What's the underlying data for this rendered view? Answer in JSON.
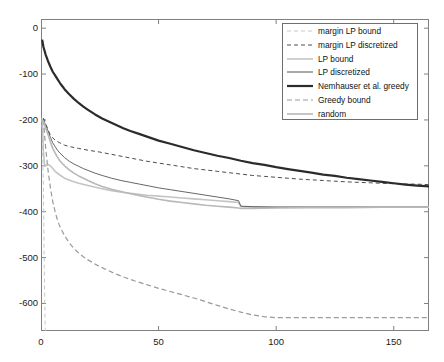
{
  "chart_data": {
    "type": "line",
    "title": "",
    "xlabel": "",
    "ylabel": "",
    "xlim": [
      0,
      165
    ],
    "ylim": [
      -660,
      20
    ],
    "xticks": [
      0,
      50,
      100,
      150
    ],
    "yticks": [
      0,
      -100,
      -200,
      -300,
      -400,
      -500,
      -600
    ],
    "xtick_labels": [
      "0",
      "50",
      "100",
      "150"
    ],
    "ytick_labels": [
      "0",
      "-100",
      "-200",
      "-300",
      "-400",
      "-500",
      "-600"
    ],
    "grid": false,
    "legend_position": "upper right",
    "series": [
      {
        "name": "margin LP bound",
        "style": "dashed",
        "color": "#c8c8c8",
        "width": 1.0,
        "points": [
          [
            0.4,
            -195
          ],
          [
            0.7,
            -260
          ],
          [
            1.0,
            -340
          ],
          [
            1.2,
            -430
          ],
          [
            1.4,
            -520
          ],
          [
            1.6,
            -600
          ],
          [
            1.8,
            -655
          ],
          [
            2.0,
            -660
          ]
        ]
      },
      {
        "name": "margin LP discretized",
        "style": "dashed",
        "color": "#4d4d4d",
        "width": 1.0,
        "points": [
          [
            1,
            -196
          ],
          [
            2,
            -208
          ],
          [
            3,
            -222
          ],
          [
            4,
            -233
          ],
          [
            5,
            -239
          ],
          [
            6,
            -244
          ],
          [
            8,
            -250
          ],
          [
            10,
            -255
          ],
          [
            13,
            -259
          ],
          [
            16,
            -262
          ],
          [
            20,
            -266
          ],
          [
            25,
            -270
          ],
          [
            30,
            -275
          ],
          [
            35,
            -280
          ],
          [
            40,
            -285
          ],
          [
            45,
            -290
          ],
          [
            50,
            -294
          ],
          [
            55,
            -298
          ],
          [
            60,
            -302
          ],
          [
            65,
            -306
          ],
          [
            70,
            -309
          ],
          [
            75,
            -312
          ],
          [
            80,
            -315
          ],
          [
            85,
            -318
          ],
          [
            90,
            -321
          ],
          [
            95,
            -323
          ],
          [
            100,
            -325
          ],
          [
            110,
            -329
          ],
          [
            120,
            -332
          ],
          [
            130,
            -335
          ],
          [
            140,
            -337
          ],
          [
            150,
            -339
          ],
          [
            160,
            -340
          ],
          [
            165,
            -341
          ]
        ]
      },
      {
        "name": "LP bound",
        "style": "solid",
        "color": "#c4c4c4",
        "width": 1.6,
        "points": [
          [
            0.6,
            -200
          ],
          [
            1,
            -268
          ],
          [
            1.5,
            -296
          ],
          [
            2,
            -300
          ],
          [
            3,
            -297
          ],
          [
            4,
            -300
          ],
          [
            5,
            -306
          ],
          [
            6,
            -312
          ],
          [
            8,
            -320
          ],
          [
            10,
            -327
          ],
          [
            13,
            -333
          ],
          [
            16,
            -338
          ],
          [
            20,
            -343
          ],
          [
            25,
            -349
          ],
          [
            30,
            -354
          ],
          [
            35,
            -358
          ],
          [
            40,
            -361
          ],
          [
            45,
            -364
          ],
          [
            50,
            -366
          ],
          [
            55,
            -368
          ],
          [
            60,
            -370
          ],
          [
            65,
            -372
          ],
          [
            70,
            -374
          ],
          [
            75,
            -376
          ],
          [
            80,
            -378
          ],
          [
            84,
            -380
          ],
          [
            85,
            -389
          ],
          [
            90,
            -390
          ],
          [
            100,
            -390
          ],
          [
            115,
            -390
          ],
          [
            130,
            -390
          ],
          [
            145,
            -390
          ],
          [
            160,
            -390
          ],
          [
            165,
            -390
          ]
        ]
      },
      {
        "name": "LP discretized",
        "style": "solid",
        "color": "#555555",
        "width": 0.9,
        "points": [
          [
            1,
            -198
          ],
          [
            2,
            -212
          ],
          [
            3,
            -224
          ],
          [
            4,
            -238
          ],
          [
            5,
            -250
          ],
          [
            6,
            -258
          ],
          [
            7,
            -266
          ],
          [
            8,
            -272
          ],
          [
            10,
            -282
          ],
          [
            12,
            -290
          ],
          [
            14,
            -296
          ],
          [
            16,
            -301
          ],
          [
            18,
            -306
          ],
          [
            20,
            -310
          ],
          [
            23,
            -316
          ],
          [
            26,
            -321
          ],
          [
            30,
            -327
          ],
          [
            34,
            -332
          ],
          [
            38,
            -336
          ],
          [
            42,
            -340
          ],
          [
            46,
            -344
          ],
          [
            50,
            -348
          ],
          [
            55,
            -352
          ],
          [
            60,
            -356
          ],
          [
            65,
            -360
          ],
          [
            70,
            -364
          ],
          [
            75,
            -368
          ],
          [
            80,
            -372
          ],
          [
            84,
            -376
          ],
          [
            85,
            -388
          ],
          [
            90,
            -389
          ],
          [
            100,
            -390
          ],
          [
            115,
            -390
          ],
          [
            130,
            -390
          ],
          [
            145,
            -390
          ],
          [
            160,
            -390
          ],
          [
            165,
            -390
          ]
        ]
      },
      {
        "name": "Nemhauser et al. greedy",
        "style": "solid",
        "color": "#2b2b2b",
        "width": 2.2,
        "points": [
          [
            0.5,
            -25
          ],
          [
            1,
            -40
          ],
          [
            2,
            -58
          ],
          [
            3,
            -72
          ],
          [
            4,
            -84
          ],
          [
            5,
            -95
          ],
          [
            6,
            -103
          ],
          [
            7,
            -111
          ],
          [
            8,
            -119
          ],
          [
            9,
            -126
          ],
          [
            10,
            -133
          ],
          [
            12,
            -144
          ],
          [
            14,
            -154
          ],
          [
            16,
            -163
          ],
          [
            18,
            -171
          ],
          [
            20,
            -178
          ],
          [
            23,
            -188
          ],
          [
            26,
            -197
          ],
          [
            29,
            -204
          ],
          [
            32,
            -211
          ],
          [
            35,
            -218
          ],
          [
            38,
            -224
          ],
          [
            42,
            -231
          ],
          [
            46,
            -238
          ],
          [
            50,
            -245
          ],
          [
            55,
            -252
          ],
          [
            60,
            -259
          ],
          [
            65,
            -266
          ],
          [
            70,
            -272
          ],
          [
            75,
            -278
          ],
          [
            80,
            -283
          ],
          [
            85,
            -289
          ],
          [
            90,
            -294
          ],
          [
            95,
            -298
          ],
          [
            100,
            -303
          ],
          [
            105,
            -307
          ],
          [
            110,
            -311
          ],
          [
            115,
            -315
          ],
          [
            120,
            -319
          ],
          [
            125,
            -322
          ],
          [
            130,
            -326
          ],
          [
            135,
            -329
          ],
          [
            140,
            -332
          ],
          [
            145,
            -335
          ],
          [
            150,
            -338
          ],
          [
            155,
            -341
          ],
          [
            160,
            -343
          ],
          [
            165,
            -345
          ]
        ]
      },
      {
        "name": "Greedy bound",
        "style": "dashed",
        "color": "#9a9a9a",
        "width": 1.2,
        "points": [
          [
            1,
            -200
          ],
          [
            2,
            -262
          ],
          [
            3,
            -310
          ],
          [
            4,
            -348
          ],
          [
            5,
            -378
          ],
          [
            6,
            -400
          ],
          [
            7,
            -418
          ],
          [
            8,
            -432
          ],
          [
            10,
            -452
          ],
          [
            12,
            -468
          ],
          [
            14,
            -480
          ],
          [
            16,
            -490
          ],
          [
            18,
            -498
          ],
          [
            20,
            -505
          ],
          [
            24,
            -517
          ],
          [
            28,
            -527
          ],
          [
            32,
            -536
          ],
          [
            36,
            -544
          ],
          [
            40,
            -551
          ],
          [
            45,
            -559
          ],
          [
            50,
            -567
          ],
          [
            55,
            -574
          ],
          [
            60,
            -581
          ],
          [
            65,
            -588
          ],
          [
            70,
            -596
          ],
          [
            75,
            -604
          ],
          [
            80,
            -612
          ],
          [
            85,
            -619
          ],
          [
            90,
            -625
          ],
          [
            95,
            -629
          ],
          [
            100,
            -631
          ],
          [
            110,
            -631
          ],
          [
            125,
            -631
          ],
          [
            140,
            -631
          ],
          [
            155,
            -631
          ],
          [
            165,
            -631
          ]
        ]
      },
      {
        "name": "random",
        "style": "solid",
        "color": "#b8b8b8",
        "width": 1.6,
        "points": [
          [
            1,
            -202
          ],
          [
            2,
            -218
          ],
          [
            3,
            -232
          ],
          [
            4,
            -248
          ],
          [
            5,
            -262
          ],
          [
            6,
            -272
          ],
          [
            7,
            -281
          ],
          [
            8,
            -289
          ],
          [
            10,
            -300
          ],
          [
            12,
            -309
          ],
          [
            14,
            -316
          ],
          [
            16,
            -322
          ],
          [
            18,
            -327
          ],
          [
            20,
            -332
          ],
          [
            23,
            -339
          ],
          [
            26,
            -345
          ],
          [
            30,
            -351
          ],
          [
            34,
            -356
          ],
          [
            38,
            -361
          ],
          [
            42,
            -365
          ],
          [
            46,
            -369
          ],
          [
            50,
            -373
          ],
          [
            55,
            -377
          ],
          [
            60,
            -380
          ],
          [
            65,
            -383
          ],
          [
            70,
            -386
          ],
          [
            75,
            -388
          ],
          [
            80,
            -390
          ],
          [
            84,
            -392
          ],
          [
            85,
            -393
          ],
          [
            90,
            -393
          ],
          [
            100,
            -392
          ],
          [
            115,
            -391
          ],
          [
            130,
            -391
          ],
          [
            145,
            -390
          ],
          [
            160,
            -390
          ],
          [
            165,
            -390
          ]
        ]
      }
    ]
  },
  "legend": {
    "items": [
      {
        "label": "margin LP bound"
      },
      {
        "label": "margin LP discretized"
      },
      {
        "label": "LP bound"
      },
      {
        "label": "LP discretized"
      },
      {
        "label": "Nemhauser et al. greedy"
      },
      {
        "label": "Greedy bound"
      },
      {
        "label": "random"
      }
    ]
  },
  "axes": {
    "axis_color": "#808080",
    "background": "#ffffff"
  }
}
